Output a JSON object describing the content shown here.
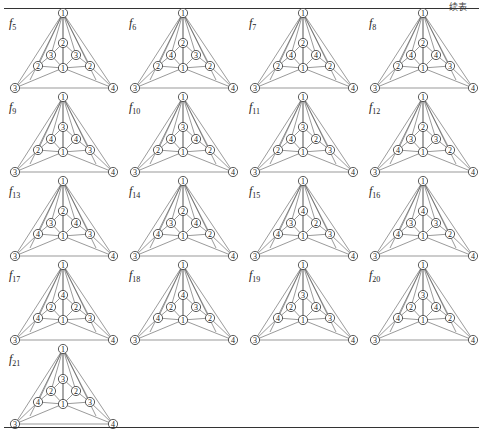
{
  "header": {
    "caption": "续表"
  },
  "layout": {
    "columns": 4,
    "rows": 5
  },
  "graphs": [
    {
      "name": "f",
      "sub": "5",
      "labels": {
        "apex": "1",
        "left": "3",
        "right": "4",
        "center": "1",
        "top": "2",
        "ul": "3",
        "ur": "3",
        "ll": "2",
        "lr": "2"
      }
    },
    {
      "name": "f",
      "sub": "6",
      "labels": {
        "apex": "1",
        "left": "3",
        "right": "4",
        "center": "1",
        "top": "2",
        "ul": "4",
        "ur": "3",
        "ll": "2",
        "lr": "2"
      }
    },
    {
      "name": "f",
      "sub": "7",
      "labels": {
        "apex": "1",
        "left": "3",
        "right": "4",
        "center": "1",
        "top": "2",
        "ul": "4",
        "ur": "4",
        "ll": "2",
        "lr": "2"
      }
    },
    {
      "name": "f",
      "sub": "8",
      "labels": {
        "apex": "1",
        "left": "3",
        "right": "4",
        "center": "1",
        "top": "2",
        "ul": "4",
        "ur": "4",
        "ll": "2",
        "lr": "3"
      }
    },
    {
      "name": "f",
      "sub": "9",
      "labels": {
        "apex": "1",
        "left": "3",
        "right": "4",
        "center": "1",
        "top": "3",
        "ul": "4",
        "ur": "4",
        "ll": "2",
        "lr": "3"
      }
    },
    {
      "name": "f",
      "sub": "10",
      "labels": {
        "apex": "1",
        "left": "3",
        "right": "4",
        "center": "1",
        "top": "3",
        "ul": "4",
        "ur": "4",
        "ll": "2",
        "lr": "2"
      }
    },
    {
      "name": "f",
      "sub": "11",
      "labels": {
        "apex": "1",
        "left": "3",
        "right": "4",
        "center": "1",
        "top": "3",
        "ul": "4",
        "ur": "2",
        "ll": "2",
        "lr": "3"
      }
    },
    {
      "name": "f",
      "sub": "12",
      "labels": {
        "apex": "1",
        "left": "3",
        "right": "4",
        "center": "1",
        "top": "2",
        "ul": "3",
        "ur": "3",
        "ll": "4",
        "lr": "2"
      }
    },
    {
      "name": "f",
      "sub": "13",
      "labels": {
        "apex": "1",
        "left": "3",
        "right": "4",
        "center": "1",
        "top": "2",
        "ul": "3",
        "ur": "4",
        "ll": "4",
        "lr": "3"
      }
    },
    {
      "name": "f",
      "sub": "14",
      "labels": {
        "apex": "1",
        "left": "3",
        "right": "4",
        "center": "1",
        "top": "2",
        "ul": "3",
        "ur": "4",
        "ll": "4",
        "lr": "2"
      }
    },
    {
      "name": "f",
      "sub": "15",
      "labels": {
        "apex": "1",
        "left": "3",
        "right": "4",
        "center": "1",
        "top": "4",
        "ul": "3",
        "ur": "2",
        "ll": "4",
        "lr": "3"
      }
    },
    {
      "name": "f",
      "sub": "16",
      "labels": {
        "apex": "1",
        "left": "3",
        "right": "4",
        "center": "1",
        "top": "4",
        "ul": "3",
        "ur": "3",
        "ll": "4",
        "lr": "2"
      }
    },
    {
      "name": "f",
      "sub": "17",
      "labels": {
        "apex": "1",
        "left": "3",
        "right": "4",
        "center": "1",
        "top": "4",
        "ul": "2",
        "ur": "2",
        "ll": "4",
        "lr": "3"
      }
    },
    {
      "name": "f",
      "sub": "18",
      "labels": {
        "apex": "1",
        "left": "3",
        "right": "4",
        "center": "1",
        "top": "4",
        "ul": "2",
        "ur": "3",
        "ll": "4",
        "lr": "2"
      }
    },
    {
      "name": "f",
      "sub": "19",
      "labels": {
        "apex": "1",
        "left": "3",
        "right": "4",
        "center": "1",
        "top": "3",
        "ul": "2",
        "ur": "4",
        "ll": "4",
        "lr": "3"
      }
    },
    {
      "name": "f",
      "sub": "20",
      "labels": {
        "apex": "1",
        "left": "3",
        "right": "4",
        "center": "1",
        "top": "3",
        "ul": "2",
        "ur": "4",
        "ll": "4",
        "lr": "2"
      }
    },
    {
      "name": "f",
      "sub": "21",
      "labels": {
        "apex": "1",
        "left": "3",
        "right": "4",
        "center": "1",
        "top": "3",
        "ul": "2",
        "ur": "2",
        "ll": "4",
        "lr": "3"
      }
    }
  ]
}
